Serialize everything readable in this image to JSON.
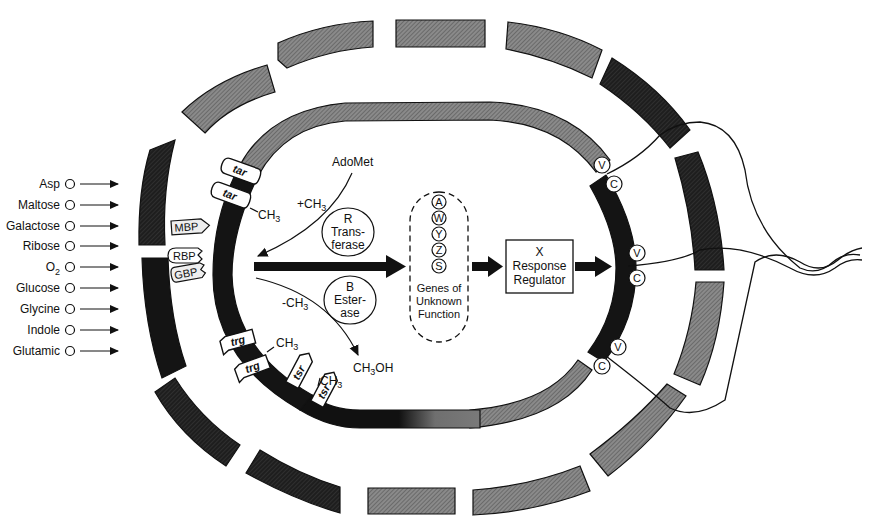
{
  "diagram": {
    "colors": {
      "dark": "#141414",
      "gray": "#7a7a7a",
      "midgray": "#5a5a5a",
      "line": "#111111",
      "background": "#ffffff"
    },
    "ligands": [
      {
        "label": "Asp"
      },
      {
        "label": "Maltose"
      },
      {
        "label": "Galactose"
      },
      {
        "label": "Ribose"
      },
      {
        "label": "O",
        "sub": "2"
      },
      {
        "label": "Glucose"
      },
      {
        "label": "Glycine"
      },
      {
        "label": "Indole"
      },
      {
        "label": "Glutamic"
      }
    ],
    "binding_proteins": [
      {
        "label": "MBP"
      },
      {
        "label": "RBP"
      },
      {
        "label": "GBP"
      }
    ],
    "receptors": [
      {
        "label": "tar",
        "methylated": false
      },
      {
        "label": "tar",
        "methylated": true
      },
      {
        "label": "trg",
        "methylated": false
      },
      {
        "label": "trg",
        "methylated": true
      },
      {
        "label": "tsr",
        "methylated": false
      },
      {
        "label": "tsr",
        "methylated": true
      }
    ],
    "methyl_group": {
      "base": "CH",
      "sub": "3"
    },
    "adomet": "AdoMet",
    "plus_methyl": {
      "prefix": "+CH",
      "sub": "3"
    },
    "minus_methyl": {
      "prefix": "-CH",
      "sub": "3"
    },
    "methanol": {
      "pre": "CH",
      "sub": "3",
      "post": "OH"
    },
    "transferase": {
      "letter": "R",
      "line1": "Trans-",
      "line2": "ferase"
    },
    "esterase": {
      "letter": "B",
      "line1": "Ester-",
      "line2": "ase"
    },
    "genes": {
      "letters": [
        "A",
        "W",
        "Y",
        "Z",
        "S"
      ],
      "caption": [
        "Genes of",
        "Unknown",
        "Function"
      ]
    },
    "response_regulator": {
      "letter": "X",
      "line1": "Response",
      "line2": "Regulator"
    },
    "motor_switch": {
      "pairs": [
        {
          "v": "V",
          "c": "C"
        },
        {
          "v": "V",
          "c": "C"
        },
        {
          "v": "V",
          "c": "C"
        }
      ]
    }
  }
}
